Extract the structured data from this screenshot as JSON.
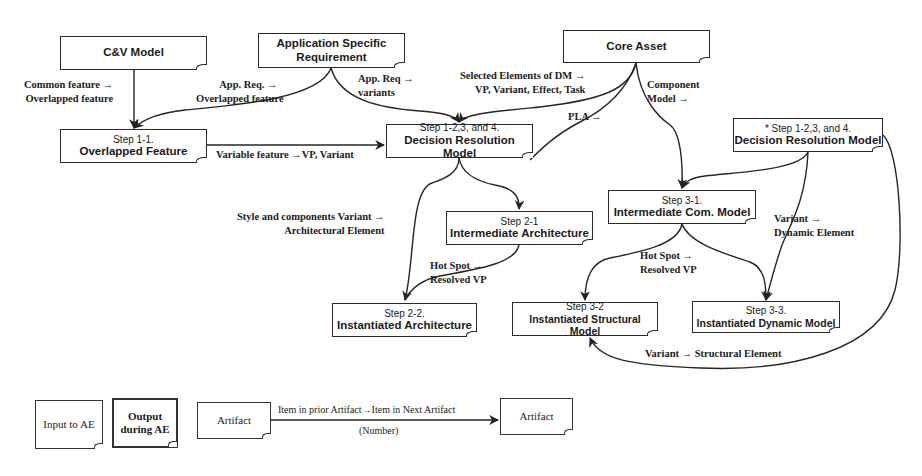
{
  "diagram": {
    "nodes": {
      "cv_model": {
        "line1": "",
        "line2": "C&V Model"
      },
      "app_req": {
        "line1": "Application Specific",
        "line2": "Requirement"
      },
      "core_asset": {
        "line1": "",
        "line2": "Core Asset"
      },
      "step_1_1": {
        "line1": "Step 1-1.",
        "line2": "Overlapped Feature"
      },
      "step_1_234_center": {
        "line1": "Step 1-2,3, and 4.",
        "line2": "Decision Resolution Model"
      },
      "step_1_234_right": {
        "line1": "* Step 1-2,3, and 4.",
        "line2": "Decision Resolution Model"
      },
      "step_2_1": {
        "line1": "Step 2-1",
        "line2": "Intermediate Architecture"
      },
      "step_3_1": {
        "line1": "Step 3-1.",
        "line2": "Intermediate Com. Model"
      },
      "step_2_2": {
        "line1": "Step 2-2.",
        "line2": "Instantiated Architecture"
      },
      "step_3_2": {
        "line1": "Step 3-2",
        "line2": "Instantiated Structural Model"
      },
      "step_3_3": {
        "line1": "Step 3-3.",
        "line2": "Instantiated Dynamic Model"
      }
    },
    "edge_labels": {
      "common_feature": {
        "line1": "Common feature →",
        "line2": "Overlapped feature"
      },
      "app_req_overlapped": {
        "line1": "App. Req. →",
        "line2": "Overlapped feature"
      },
      "app_req_variants": {
        "line1": "App. Req →",
        "line2": "variants"
      },
      "selected_elements": {
        "line1": "Selected Elements of DM →",
        "line2": "VP, Variant, Effect, Task"
      },
      "component_model": {
        "line1": "Component",
        "line2": "Model →"
      },
      "pla": {
        "line1": "PLA →"
      },
      "variable_feature": {
        "line1": "Variable feature →VP, Variant"
      },
      "style_components": {
        "line1": "Style and components Variant →",
        "line2": "Architectural Element"
      },
      "hot_spot_arch": {
        "line1": "Hot Spot →",
        "line2": "Resolved VP"
      },
      "hot_spot_com": {
        "line1": "Hot Spot →",
        "line2": "Resolved VP"
      },
      "variant_dynamic": {
        "line1": "Variant →",
        "line2": "Dynamic Element"
      },
      "variant_structural": {
        "line1": "Variant → Structural Element"
      }
    }
  },
  "legend": {
    "input_box": "Input to AE",
    "output_box_line1": "Output",
    "output_box_line2": "during AE",
    "artifact_left": "Artifact",
    "arrow_label": "Item in prior Artifact→Item in Next Artifact",
    "arrow_number": "(Number)",
    "artifact_right": "Artifact"
  }
}
